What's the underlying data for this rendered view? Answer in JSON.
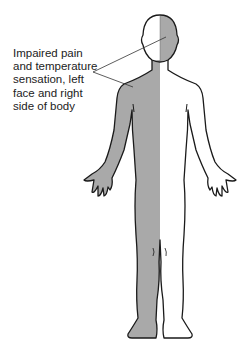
{
  "diagram": {
    "type": "body-sensory-map",
    "annotation": {
      "lines": [
        "Impaired pain",
        "and temperature",
        "sensation, left",
        "face and right",
        "side of body"
      ]
    },
    "regions": [
      {
        "name": "left-face",
        "shaded": true
      },
      {
        "name": "right-face",
        "shaded": false
      },
      {
        "name": "right-body",
        "shaded": true
      },
      {
        "name": "left-body",
        "shaded": false
      }
    ],
    "colors": {
      "shade": "#a9a9a9",
      "outline": "#1a1a1a",
      "background": "#ffffff",
      "text": "#222222"
    }
  }
}
